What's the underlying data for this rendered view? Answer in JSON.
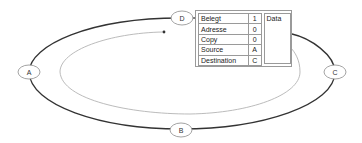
{
  "diagram": {
    "nodes": [
      {
        "id": "D",
        "label": "D"
      },
      {
        "id": "A",
        "label": "A"
      },
      {
        "id": "B",
        "label": "B"
      },
      {
        "id": "C",
        "label": "C"
      }
    ],
    "packet": {
      "fields": [
        {
          "label": "Belegt",
          "value": "1"
        },
        {
          "label": "Adresse",
          "value": "0"
        },
        {
          "label": "Copy",
          "value": "0"
        },
        {
          "label": "Source",
          "value": "A"
        },
        {
          "label": "Destination",
          "value": "C"
        }
      ],
      "data_label": "Data"
    },
    "colors": {
      "ring": "#333333",
      "path": "#b0b0b0",
      "node_border": "#999999"
    }
  }
}
